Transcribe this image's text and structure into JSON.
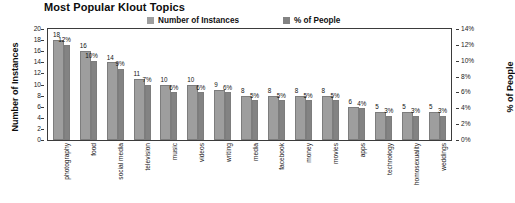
{
  "chart_data": {
    "type": "bar",
    "title": "Most Popular Klout Topics",
    "xlabel": "",
    "ylabel": "Number of Instances",
    "y2label": "% of People",
    "ylim": [
      0,
      20
    ],
    "y2lim": [
      0,
      14
    ],
    "grid": false,
    "legend_position": "top",
    "categories": [
      "photography",
      "food",
      "social media",
      "television",
      "music",
      "videos",
      "writing",
      "media",
      "facebook",
      "money",
      "movies",
      "apps",
      "technology",
      "homosexuality",
      "weddings"
    ],
    "series": [
      {
        "name": "Number of Instances",
        "color": "#9e9e9e",
        "axis": "left",
        "values": [
          18,
          16,
          14,
          11,
          10,
          10,
          9,
          8,
          8,
          8,
          8,
          6,
          5,
          5,
          5
        ],
        "labels": [
          "18",
          "16",
          "14",
          "11",
          "10",
          "10",
          "9",
          "8",
          "8",
          "8",
          "8",
          "6",
          "5",
          "5",
          "5"
        ]
      },
      {
        "name": "% of People",
        "color": "#838383",
        "axis": "right",
        "values": [
          12,
          10,
          9,
          7,
          6,
          6,
          6,
          5,
          5,
          5,
          5,
          4,
          3,
          3,
          3
        ],
        "labels": [
          "12%",
          "10%",
          "9%",
          "7%",
          "6%",
          "6%",
          "6%",
          "5%",
          "5%",
          "5%",
          "5%",
          "4%",
          "3%",
          "3%",
          "3%"
        ]
      }
    ],
    "left_ticks": [
      "20",
      "18",
      "16",
      "14",
      "12",
      "10",
      "8",
      "6",
      "4",
      "2",
      "0"
    ],
    "right_ticks": [
      "14%",
      "12%",
      "10%",
      "8%",
      "6%",
      "4%",
      "2%",
      "0%"
    ]
  },
  "legend": {
    "items": [
      {
        "label": "Number of Instances",
        "color": "#9e9e9e"
      },
      {
        "label": "% of People",
        "color": "#838383"
      }
    ]
  }
}
